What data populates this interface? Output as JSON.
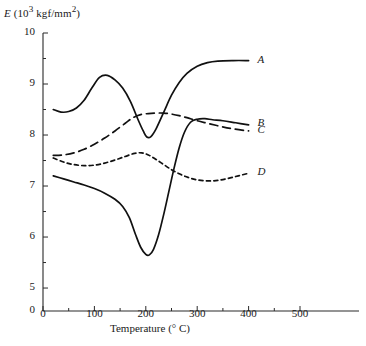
{
  "chart_data": {
    "type": "line",
    "title": "",
    "xlabel": "Temperature (° C)",
    "ylabel": "E (10³ kgf/mm²)",
    "ylabel_parts": {
      "symbol": "E",
      "unit_prefix": "(10",
      "exponent": "3",
      "unit": " kgf/mm",
      "unit_exponent": "2",
      "unit_suffix": ")"
    },
    "xlim": [
      0,
      500
    ],
    "ylim": [
      4.55,
      10
    ],
    "xticks": [
      0,
      100,
      200,
      300,
      400,
      500
    ],
    "yticks": [
      5,
      6,
      7,
      8,
      9,
      10
    ],
    "yticks_extra": [
      0
    ],
    "xtick_labels": [
      "0",
      "100",
      "200",
      "300",
      "400",
      "500"
    ],
    "ytick_labels": [
      "5",
      "6",
      "7",
      "8",
      "9",
      "10"
    ],
    "ytick_origin_label": "0",
    "grid": false,
    "legend_position": "right-inline",
    "minor_ticks": true,
    "axis_break": true,
    "series": [
      {
        "name": "A",
        "label": "A",
        "style": "solid",
        "color": "#111111",
        "label_x": 400,
        "label_y": 9.45,
        "points": [
          [
            20,
            8.5
          ],
          [
            35,
            8.45
          ],
          [
            50,
            8.46
          ],
          [
            65,
            8.53
          ],
          [
            80,
            8.68
          ],
          [
            95,
            8.92
          ],
          [
            110,
            9.13
          ],
          [
            125,
            9.17
          ],
          [
            140,
            9.08
          ],
          [
            155,
            8.92
          ],
          [
            170,
            8.66
          ],
          [
            185,
            8.3
          ],
          [
            195,
            8.08
          ],
          [
            202,
            7.96
          ],
          [
            210,
            7.97
          ],
          [
            220,
            8.12
          ],
          [
            235,
            8.45
          ],
          [
            250,
            8.78
          ],
          [
            265,
            9.03
          ],
          [
            280,
            9.21
          ],
          [
            300,
            9.35
          ],
          [
            320,
            9.42
          ],
          [
            340,
            9.45
          ],
          [
            370,
            9.46
          ],
          [
            400,
            9.46
          ]
        ]
      },
      {
        "name": "B",
        "label": "B",
        "style": "solid",
        "color": "#111111",
        "label_x": 400,
        "label_y": 8.22,
        "points": [
          [
            20,
            7.2
          ],
          [
            40,
            7.14
          ],
          [
            60,
            7.08
          ],
          [
            80,
            7.02
          ],
          [
            100,
            6.95
          ],
          [
            120,
            6.86
          ],
          [
            140,
            6.74
          ],
          [
            155,
            6.6
          ],
          [
            168,
            6.38
          ],
          [
            180,
            6.05
          ],
          [
            190,
            5.8
          ],
          [
            200,
            5.66
          ],
          [
            207,
            5.65
          ],
          [
            215,
            5.76
          ],
          [
            225,
            6.05
          ],
          [
            235,
            6.45
          ],
          [
            245,
            6.9
          ],
          [
            255,
            7.35
          ],
          [
            265,
            7.75
          ],
          [
            275,
            8.05
          ],
          [
            287,
            8.25
          ],
          [
            300,
            8.31
          ],
          [
            315,
            8.32
          ],
          [
            330,
            8.3
          ],
          [
            350,
            8.28
          ],
          [
            375,
            8.24
          ],
          [
            400,
            8.2
          ]
        ]
      },
      {
        "name": "C",
        "label": "C",
        "style": "dashed-long",
        "color": "#111111",
        "label_x": 400,
        "label_y": 8.08,
        "points": [
          [
            20,
            7.6
          ],
          [
            40,
            7.61
          ],
          [
            60,
            7.65
          ],
          [
            80,
            7.72
          ],
          [
            100,
            7.82
          ],
          [
            120,
            7.94
          ],
          [
            140,
            8.08
          ],
          [
            160,
            8.23
          ],
          [
            175,
            8.34
          ],
          [
            190,
            8.4
          ],
          [
            205,
            8.42
          ],
          [
            220,
            8.43
          ],
          [
            235,
            8.43
          ],
          [
            250,
            8.41
          ],
          [
            265,
            8.38
          ],
          [
            280,
            8.34
          ],
          [
            300,
            8.28
          ],
          [
            320,
            8.23
          ],
          [
            345,
            8.17
          ],
          [
            370,
            8.12
          ],
          [
            400,
            8.08
          ]
        ]
      },
      {
        "name": "D",
        "label": "D",
        "style": "dashed-short",
        "color": "#111111",
        "label_x": 400,
        "label_y": 7.25,
        "points": [
          [
            20,
            7.55
          ],
          [
            40,
            7.47
          ],
          [
            60,
            7.42
          ],
          [
            80,
            7.4
          ],
          [
            100,
            7.41
          ],
          [
            120,
            7.45
          ],
          [
            140,
            7.51
          ],
          [
            160,
            7.58
          ],
          [
            178,
            7.64
          ],
          [
            192,
            7.65
          ],
          [
            205,
            7.61
          ],
          [
            220,
            7.52
          ],
          [
            235,
            7.42
          ],
          [
            250,
            7.32
          ],
          [
            265,
            7.24
          ],
          [
            282,
            7.17
          ],
          [
            300,
            7.12
          ],
          [
            320,
            7.1
          ],
          [
            340,
            7.11
          ],
          [
            360,
            7.15
          ],
          [
            380,
            7.2
          ],
          [
            400,
            7.25
          ]
        ]
      }
    ]
  }
}
